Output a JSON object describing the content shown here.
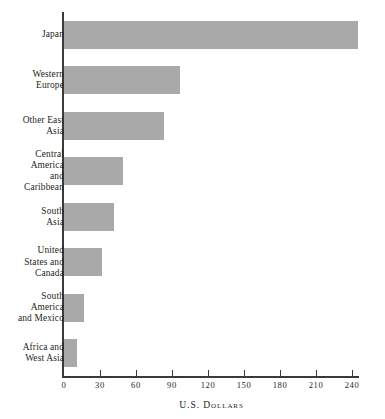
{
  "chart_data": {
    "type": "bar",
    "orientation": "horizontal",
    "title": "",
    "xlabel": "U.S. Dollars",
    "ylabel": "",
    "categories": [
      "Japan",
      "Western Europe",
      "Other East Asia",
      "Central America and Caribbean",
      "South Asia",
      "United States and Canada",
      "South America and Mexico",
      "Africa and West Asia"
    ],
    "values": [
      245,
      97,
      83,
      49,
      42,
      32,
      17,
      11
    ],
    "xlim": [
      0,
      250
    ],
    "xticks": [
      0,
      30,
      60,
      90,
      120,
      150,
      180,
      210,
      240
    ],
    "xtick_labels": [
      "0",
      "30",
      "60",
      "90",
      "120",
      "150",
      "180",
      "210",
      "240"
    ],
    "grid": false,
    "legend": false,
    "bar_color": "#a9a9a9",
    "axis_color": "#3a3a3a",
    "text_color": "#231f20"
  },
  "axis": {
    "title": "U.S. Dollars"
  },
  "categories": [
    {
      "lines": [
        "Japan"
      ]
    },
    {
      "lines": [
        "Western",
        "Europe"
      ]
    },
    {
      "lines": [
        "Other East",
        "Asia"
      ]
    },
    {
      "lines": [
        "Central",
        "America",
        "and",
        "Caribbean"
      ]
    },
    {
      "lines": [
        "South",
        "Asia"
      ]
    },
    {
      "lines": [
        "United",
        "States and",
        "Canada"
      ]
    },
    {
      "lines": [
        "South",
        "America",
        "and Mexico"
      ]
    },
    {
      "lines": [
        "Africa and",
        "West Asia"
      ]
    }
  ]
}
